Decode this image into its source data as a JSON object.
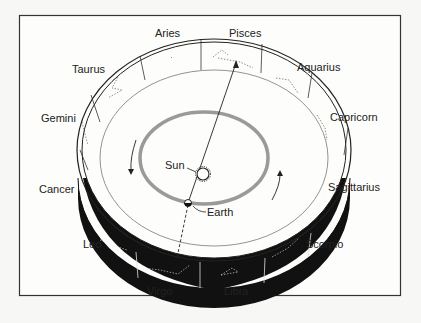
{
  "diagram": {
    "constellations": [
      {
        "name": "Aries",
        "x": 155,
        "y": 27
      },
      {
        "name": "Pisces",
        "x": 229,
        "y": 27
      },
      {
        "name": "Taurus",
        "x": 72,
        "y": 62
      },
      {
        "name": "Aquarius",
        "x": 297,
        "y": 60
      },
      {
        "name": "Gemini",
        "x": 41,
        "y": 112
      },
      {
        "name": "Capricorn",
        "x": 330,
        "y": 110
      },
      {
        "name": "Cancer",
        "x": 39,
        "y": 182
      },
      {
        "name": "Sagittarius",
        "x": 328,
        "y": 180
      },
      {
        "name": "Leo",
        "x": 83,
        "y": 238
      },
      {
        "name": "Scorpio",
        "x": 306,
        "y": 238
      },
      {
        "name": "Virgo",
        "x": 147,
        "y": 285
      },
      {
        "name": "Libra",
        "x": 224,
        "y": 285
      }
    ],
    "sun_label": "Sun",
    "earth_label": "Earth",
    "colors": {
      "frame": "#333333",
      "orbit": "#9a9a9a",
      "band_dark": "#111111",
      "background": "#f7f7f5"
    }
  }
}
